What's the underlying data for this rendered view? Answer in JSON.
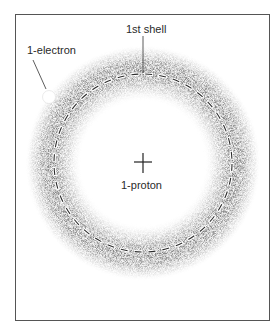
{
  "diagram": {
    "labels": {
      "shell": "1st shell",
      "electron": "1-electron",
      "nucleus": "1-proton"
    },
    "geometry": {
      "center": [
        143,
        163
      ],
      "shell_radius": 89,
      "cloud_inner_radius": 66,
      "cloud_outer_radius": 116,
      "electron_position": [
        49,
        97
      ],
      "electron_radius": 6
    },
    "colors": {
      "frame": "#555555",
      "cloud": "#333333",
      "dash": "#ffffff",
      "background": "#ffffff"
    }
  }
}
